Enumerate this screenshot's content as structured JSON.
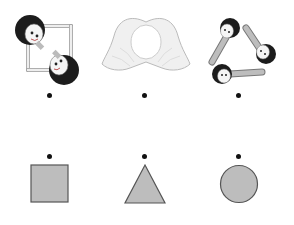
{
  "exercise": {
    "type": "matching",
    "instruction": "",
    "pictures": [
      {
        "id": "two-kids-square",
        "description": "two children lying to form a square",
        "dot": {
          "x": 50,
          "y": 95
        }
      },
      {
        "id": "hands-circle",
        "description": "two hands forming a circle",
        "dot": {
          "x": 145,
          "y": 95
        }
      },
      {
        "id": "three-kids-triangle",
        "description": "three children lying to form a triangle",
        "dot": {
          "x": 238,
          "y": 95
        }
      }
    ],
    "shapes": [
      {
        "id": "square",
        "label": "square",
        "dot": {
          "x": 50,
          "y": 156
        }
      },
      {
        "id": "triangle",
        "label": "triangle",
        "dot": {
          "x": 145,
          "y": 156
        }
      },
      {
        "id": "circle",
        "label": "circle",
        "dot": {
          "x": 238,
          "y": 156
        }
      }
    ]
  },
  "colors": {
    "shape_fill": "#bdbdbd",
    "shape_stroke": "#555555",
    "dot": "#111111",
    "hair": "#1c1c1c",
    "skin": "#f2f2f2",
    "outline": "#888888"
  }
}
